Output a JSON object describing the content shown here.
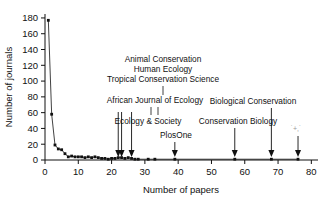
{
  "chart_data": {
    "type": "scatter",
    "title": "",
    "xlabel": "Number of papers",
    "ylabel": "Number of journals",
    "xlim": [
      0,
      82
    ],
    "ylim": [
      0,
      185
    ],
    "xticks": [
      0,
      10,
      20,
      30,
      40,
      50,
      60,
      70,
      80
    ],
    "yticks": [
      0,
      20,
      40,
      60,
      80,
      100,
      120,
      140,
      160,
      180
    ],
    "grid": false,
    "legend_position": "none",
    "marker": "filled-square",
    "connected": true,
    "x": [
      1,
      2,
      3,
      4,
      5,
      6,
      7,
      8,
      9,
      10,
      11,
      12,
      13,
      14,
      15,
      16,
      17,
      18,
      19,
      20,
      21,
      22,
      23,
      24,
      25,
      26,
      27,
      28,
      31,
      33,
      39,
      57,
      68,
      76
    ],
    "y": [
      177,
      58,
      19,
      14,
      13,
      8,
      4,
      5,
      4,
      4,
      4,
      3,
      4,
      3,
      4,
      3,
      2,
      2,
      1,
      2,
      2,
      3,
      3,
      2,
      3,
      2,
      1,
      1,
      1,
      1,
      1,
      1,
      1,
      1
    ],
    "annotations": [
      {
        "label": "Animal Conservation",
        "x": 23,
        "line": 1
      },
      {
        "label": "Human Ecology",
        "x": 23,
        "line": 2
      },
      {
        "label": "Tropical Conservation Science",
        "x": 23,
        "line": 3
      },
      {
        "label": "African Journal of Ecology",
        "x": 23,
        "line": 4
      },
      {
        "label": "Ecology & Society",
        "x": 26,
        "line": 5
      },
      {
        "label": "PlosOne",
        "x": 39,
        "line": 6
      },
      {
        "label": "Conservation Biology",
        "x": 57,
        "line": 6
      },
      {
        "label": "Biological Conservation",
        "x": 68,
        "line": 5
      },
      {
        "label": "",
        "x": 76,
        "line": 6,
        "faint": true
      }
    ],
    "arrow_targets": [
      22,
      23,
      26,
      39,
      57,
      68,
      76
    ]
  },
  "axes": {
    "ylabel": "Number of journals",
    "xlabel": "Number of papers",
    "yticklabels": [
      "0",
      "20",
      "40",
      "60",
      "80",
      "100",
      "120",
      "140",
      "160",
      "180"
    ],
    "xticklabels": [
      "0",
      "10",
      "20",
      "30",
      "40",
      "50",
      "60",
      "70",
      "80"
    ]
  },
  "labels": {
    "animal_conservation": "Animal Conservation",
    "human_ecology": "Human Ecology",
    "tropical_conservation_science": "Tropical Conservation Science",
    "african_journal_of_ecology": "African Journal of Ecology",
    "ecology_and_society": "Ecology & Society",
    "plosone": "PlosOne",
    "conservation_biology": "Conservation Biology",
    "biological_conservation": "Biological Conservation"
  }
}
